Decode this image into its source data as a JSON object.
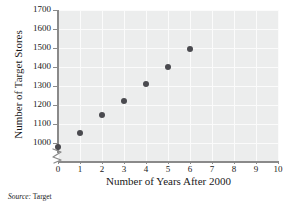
{
  "chart_data": {
    "type": "scatter",
    "title": "",
    "xlabel": "Number of Years After 2000",
    "ylabel": "Number of Target Stores",
    "xlim": [
      0,
      10
    ],
    "ylim": [
      950,
      1700
    ],
    "xticks": [
      "0",
      "1",
      "2",
      "3",
      "4",
      "5",
      "6",
      "7",
      "8",
      "9",
      "10"
    ],
    "yticks": [
      "1000",
      "1100",
      "1200",
      "1300",
      "1400",
      "1500",
      "1600",
      "1700"
    ],
    "grid": true,
    "legend": false,
    "y_axis_break": true,
    "x": [
      0,
      1,
      2,
      3,
      4,
      5,
      6
    ],
    "values": [
      980,
      1055,
      1150,
      1225,
      1310,
      1400,
      1495
    ],
    "points": [
      {
        "x": 0,
        "y": 980
      },
      {
        "x": 1,
        "y": 1055
      },
      {
        "x": 2,
        "y": 1150
      },
      {
        "x": 3,
        "y": 1225
      },
      {
        "x": 4,
        "y": 1310
      },
      {
        "x": 5,
        "y": 1400
      },
      {
        "x": 6,
        "y": 1495
      }
    ],
    "marker_color": "#4a4a4f",
    "panel_color": "#eceded",
    "gridline_color": "#fbfbfb",
    "axis_color": "#8a8a8a"
  },
  "source": {
    "label": "Source:",
    "value": "Target"
  }
}
